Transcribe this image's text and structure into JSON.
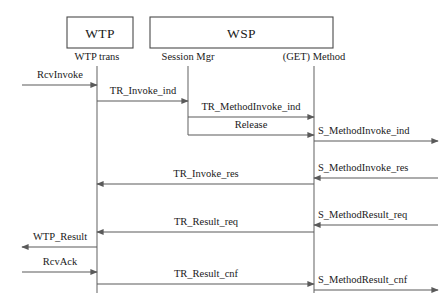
{
  "diagram": {
    "type": "uml-sequence-diagram",
    "title": "",
    "width": 444,
    "height": 304,
    "background_color": "#ffffff",
    "line_color": "#5a5a5a",
    "text_color": "#1a1a1a",
    "boxes": [
      {
        "id": "wtp",
        "label": "WTP",
        "x": 67,
        "y": 17,
        "width": 66,
        "height": 31
      },
      {
        "id": "wsp",
        "label": "WSP",
        "x": 150,
        "y": 17,
        "width": 183,
        "height": 31
      }
    ],
    "lifelines": [
      {
        "id": "wtp-trans",
        "label": "WTP trans",
        "x": 97,
        "label_y": 60,
        "top": 66,
        "bottom": 293
      },
      {
        "id": "session-mgr",
        "label": "Session Mgr",
        "x": 188,
        "label_y": 60,
        "top": 66,
        "bottom": 135
      },
      {
        "id": "get-method",
        "label": "(GET) Method",
        "x": 314,
        "label_y": 60,
        "top": 66,
        "bottom": 293
      }
    ],
    "messages": [
      {
        "id": "m1",
        "label": "RcvInvoke",
        "from_x": 22,
        "to_x": 97,
        "y": 85,
        "direction": "right",
        "label_x": 60,
        "label_y": 78,
        "align": "center"
      },
      {
        "id": "m2",
        "label": "TR_Invoke_ind",
        "from_x": 97,
        "to_x": 188,
        "y": 101,
        "direction": "right",
        "label_x": 143,
        "label_y": 94,
        "align": "center"
      },
      {
        "id": "m3",
        "label": "TR_MethodInvoke_ind",
        "from_x": 188,
        "to_x": 314,
        "y": 117,
        "direction": "right",
        "label_x": 251,
        "label_y": 110,
        "align": "center"
      },
      {
        "id": "m4",
        "label": "Release",
        "from_x": 188,
        "to_x": 314,
        "y": 135,
        "direction": "right",
        "label_x": 251,
        "label_y": 128,
        "align": "center"
      },
      {
        "id": "m5",
        "label": "S_MethodInvoke_ind",
        "from_x": 314,
        "to_x": 438,
        "y": 141,
        "direction": "right",
        "label_x": 318,
        "label_y": 134,
        "align": "start"
      },
      {
        "id": "m6",
        "label": "S_MethodInvoke_res",
        "from_x": 438,
        "to_x": 314,
        "y": 178,
        "direction": "left",
        "label_x": 318,
        "label_y": 171,
        "align": "start"
      },
      {
        "id": "m7",
        "label": "TR_Invoke_res",
        "from_x": 314,
        "to_x": 97,
        "y": 184,
        "direction": "left",
        "label_x": 206,
        "label_y": 177,
        "align": "center"
      },
      {
        "id": "m8",
        "label": "S_MethodResult_req",
        "from_x": 438,
        "to_x": 314,
        "y": 225,
        "direction": "left",
        "label_x": 318,
        "label_y": 218,
        "align": "start"
      },
      {
        "id": "m9",
        "label": "TR_Result_req",
        "from_x": 314,
        "to_x": 97,
        "y": 232,
        "direction": "left",
        "label_x": 206,
        "label_y": 225,
        "align": "center"
      },
      {
        "id": "m10",
        "label": "WTP_Result",
        "from_x": 97,
        "to_x": 22,
        "y": 247,
        "direction": "left",
        "label_x": 60,
        "label_y": 240,
        "align": "center"
      },
      {
        "id": "m11",
        "label": "RcvAck",
        "from_x": 22,
        "to_x": 97,
        "y": 272,
        "direction": "right",
        "label_x": 60,
        "label_y": 265,
        "align": "center"
      },
      {
        "id": "m12",
        "label": "TR_Result_cnf",
        "from_x": 97,
        "to_x": 314,
        "y": 284,
        "direction": "right",
        "label_x": 206,
        "label_y": 277,
        "align": "center"
      },
      {
        "id": "m13",
        "label": "S_MethodResult_cnf",
        "from_x": 314,
        "to_x": 438,
        "y": 290,
        "direction": "right",
        "label_x": 318,
        "label_y": 283,
        "align": "start"
      }
    ]
  }
}
